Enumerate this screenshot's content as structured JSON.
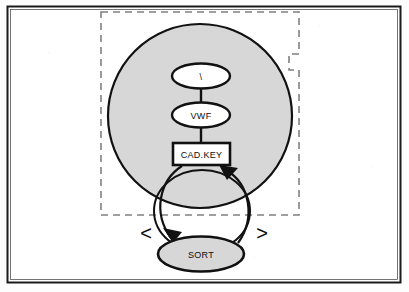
{
  "figure": {
    "kind": "block-diagram",
    "background_color": "#fdfdfd",
    "frame": {
      "name": "outer-frame",
      "stroke_color": "#1a1a1a",
      "fill_color": "#ffffff",
      "x": 7,
      "y": 6,
      "width": 394,
      "height": 277
    },
    "dashed_boundary": {
      "name": "dashed-region-boundary",
      "stroke_color": "#7a7a7a",
      "style": "dashed",
      "notch": "right-edge-step-inward"
    },
    "big_region": {
      "name": "large-shaded-circle",
      "fill_color": "#d7d7d7",
      "stroke_color": "#111111",
      "cx": 200,
      "cy": 116,
      "r": 92
    },
    "loop_circle": {
      "name": "feedback-loop-circle",
      "fill_color": "none",
      "stroke_color": "#111111",
      "cx": 202,
      "cy": 211,
      "rx": 48,
      "ry": 40
    },
    "nodes": [
      {
        "id": "top-ellipse",
        "name": "node-top-ellipse",
        "shape": "ellipse",
        "label": "\\",
        "fill_color": "#ffffff",
        "stroke_color": "#111111",
        "cx": 201,
        "cy": 76,
        "rx": 29,
        "ry": 12
      },
      {
        "id": "vwf",
        "name": "node-vwf",
        "shape": "ellipse",
        "label": "VWF",
        "fill_color": "#ffffff",
        "stroke_color": "#111111",
        "cx": 201,
        "cy": 115,
        "rx": 29,
        "ry": 12
      },
      {
        "id": "cadkey",
        "name": "node-cad-key",
        "shape": "rectangle",
        "label": "CAD.KEY",
        "fill_color": "#ffffff",
        "stroke_color": "#111111",
        "x": 173,
        "y": 143,
        "width": 57,
        "height": 22
      },
      {
        "id": "sort",
        "name": "node-sort",
        "shape": "ellipse",
        "label": "SORT",
        "fill_color": "#d7d7d7",
        "stroke_color": "#111111",
        "cx": 201,
        "cy": 254,
        "rx": 43,
        "ry": 17
      }
    ],
    "connectors": [
      {
        "name": "connector-top-to-vwf",
        "from": "top-ellipse",
        "to": "vwf",
        "style": "solid-line",
        "arrow": false
      },
      {
        "name": "connector-vwf-to-cadkey",
        "from": "vwf",
        "to": "cadkey",
        "style": "solid-line",
        "arrow": false
      },
      {
        "name": "connector-cadkey-to-sort",
        "from": "cadkey",
        "to": "sort",
        "style": "curved-arc-left",
        "arrow": true,
        "arrow_target": "sort"
      },
      {
        "name": "connector-sort-to-cadkey",
        "from": "sort",
        "to": "cadkey",
        "style": "curved-arc-right",
        "arrow": true,
        "arrow_target": "cadkey"
      }
    ],
    "glyphs": [
      {
        "name": "left-angle-bracket-glyph",
        "label": "<",
        "x": 146,
        "y": 240
      },
      {
        "name": "right-angle-bracket-glyph",
        "label": ">",
        "x": 262,
        "y": 240
      }
    ]
  }
}
